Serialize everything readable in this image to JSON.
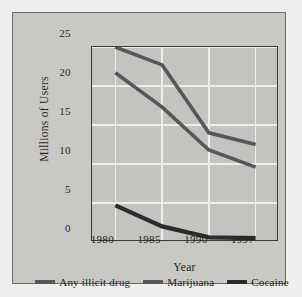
{
  "chart_data": {
    "type": "line",
    "title": "",
    "xlabel": "Year",
    "ylabel": "Millions of Users",
    "categories": [
      "1980",
      "1985",
      "1990",
      "1997"
    ],
    "x_tick_labels": [
      "1980",
      "1985",
      "1990",
      "1997"
    ],
    "y_tick_labels": [
      "0",
      "5",
      "10",
      "15",
      "20",
      "25"
    ],
    "y_ticks": [
      0,
      5,
      10,
      15,
      20,
      25
    ],
    "ylim": [
      0,
      25
    ],
    "grid": "horizontal-and-vertical",
    "legend_position": "bottom",
    "series": [
      {
        "name": "Any illicit drug",
        "color": "#57565a",
        "values": [
          25.0,
          22.7,
          14.0,
          12.5
        ]
      },
      {
        "name": "Marijuana",
        "color": "#57565a",
        "values": [
          21.7,
          17.3,
          11.8,
          9.6
        ]
      },
      {
        "name": "Cocaine",
        "color": "#2b2b2d",
        "values": [
          4.7,
          2.0,
          0.6,
          0.5
        ]
      }
    ]
  },
  "legend": {
    "entries": [
      {
        "label": "Any illicit drug",
        "color": "#57565a"
      },
      {
        "label": "Marijuana",
        "color": "#57565a"
      },
      {
        "label": "Cocaine",
        "color": "#2b2b2d"
      }
    ]
  },
  "colors": {
    "page_background": "#efeeec",
    "figure_background": "#c9c8c5",
    "plot_background": "#c4c3bf",
    "gridline": "#efeeea",
    "axis": "#3a3a38",
    "text": "#26261f"
  }
}
